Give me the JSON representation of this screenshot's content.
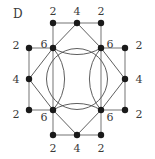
{
  "figure": {
    "panel_letter": "D",
    "panel_letter_x": 13,
    "panel_letter_y": 8,
    "width": 155,
    "height": 159,
    "background_color": "#ffffff",
    "edge_color": "#808080",
    "chord_color": "#4d4d4d",
    "circle_color": "#4d4d4d",
    "node_color": "#1a1a1a",
    "label_color": "#3a3a3a",
    "node_radius": 3.2,
    "circle": {
      "cx": 77,
      "cy": 79,
      "r": 30.5
    }
  },
  "chart_data": {
    "type": "diagram",
    "title": "D",
    "xlabel": "",
    "ylabel": "",
    "nodes": [
      {
        "id": "n0",
        "x": 53,
        "y": 23,
        "value": "2",
        "label_x": 53,
        "label_y": 11,
        "label_pos": "above"
      },
      {
        "id": "n1",
        "x": 77,
        "y": 23,
        "value": "4",
        "label_x": 77,
        "label_y": 11,
        "label_pos": "above"
      },
      {
        "id": "n2",
        "x": 101,
        "y": 23,
        "value": "2",
        "label_x": 101,
        "label_y": 11,
        "label_pos": "above"
      },
      {
        "id": "n3",
        "x": 29,
        "y": 48,
        "value": "2",
        "label_x": 16,
        "label_y": 45,
        "label_pos": "left"
      },
      {
        "id": "n4",
        "x": 53,
        "y": 48,
        "value": "6",
        "label_x": 44,
        "label_y": 44,
        "label_pos": "upper-left"
      },
      {
        "id": "n5",
        "x": 101,
        "y": 48,
        "value": "6",
        "label_x": 110,
        "label_y": 44,
        "label_pos": "upper-right"
      },
      {
        "id": "n6",
        "x": 125,
        "y": 48,
        "value": "2",
        "label_x": 139,
        "label_y": 45,
        "label_pos": "right"
      },
      {
        "id": "n7",
        "x": 29,
        "y": 79,
        "value": "4",
        "label_x": 16,
        "label_y": 79,
        "label_pos": "left"
      },
      {
        "id": "n8",
        "x": 125,
        "y": 79,
        "value": "4",
        "label_x": 139,
        "label_y": 79,
        "label_pos": "right"
      },
      {
        "id": "n9",
        "x": 29,
        "y": 110,
        "value": "2",
        "label_x": 16,
        "label_y": 114,
        "label_pos": "left"
      },
      {
        "id": "n10",
        "x": 53,
        "y": 110,
        "value": "6",
        "label_x": 44,
        "label_y": 117,
        "label_pos": "lower-left"
      },
      {
        "id": "n11",
        "x": 101,
        "y": 110,
        "value": "6",
        "label_x": 110,
        "label_y": 117,
        "label_pos": "lower-right"
      },
      {
        "id": "n12",
        "x": 125,
        "y": 110,
        "value": "2",
        "label_x": 139,
        "label_y": 114,
        "label_pos": "right"
      },
      {
        "id": "n13",
        "x": 53,
        "y": 135,
        "value": "2",
        "label_x": 53,
        "label_y": 148,
        "label_pos": "below"
      },
      {
        "id": "n14",
        "x": 77,
        "y": 135,
        "value": "4",
        "label_x": 77,
        "label_y": 148,
        "label_pos": "below"
      },
      {
        "id": "n15",
        "x": 101,
        "y": 135,
        "value": "2",
        "label_x": 101,
        "label_y": 148,
        "label_pos": "below"
      }
    ],
    "straight_edges": [
      [
        "n0",
        "n1"
      ],
      [
        "n1",
        "n2"
      ],
      [
        "n0",
        "n4"
      ],
      [
        "n2",
        "n5"
      ],
      [
        "n3",
        "n4"
      ],
      [
        "n3",
        "n7"
      ],
      [
        "n6",
        "n5"
      ],
      [
        "n6",
        "n8"
      ],
      [
        "n7",
        "n9"
      ],
      [
        "n8",
        "n12"
      ],
      [
        "n9",
        "n10"
      ],
      [
        "n12",
        "n11"
      ],
      [
        "n10",
        "n13"
      ],
      [
        "n11",
        "n15"
      ],
      [
        "n13",
        "n14"
      ],
      [
        "n14",
        "n15"
      ],
      [
        "n4",
        "n10"
      ],
      [
        "n5",
        "n11"
      ]
    ],
    "chord_edges": [
      [
        "n4",
        "n1"
      ],
      [
        "n1",
        "n5"
      ],
      [
        "n4",
        "n7"
      ],
      [
        "n7",
        "n10"
      ],
      [
        "n5",
        "n8"
      ],
      [
        "n8",
        "n11"
      ],
      [
        "n10",
        "n14"
      ],
      [
        "n14",
        "n11"
      ]
    ],
    "arc_edges": [
      {
        "from": "n4",
        "to": "n5",
        "sweep": 0,
        "note": "top arc bulging upward"
      },
      {
        "from": "n10",
        "to": "n11",
        "sweep": 1,
        "note": "bottom arc bulging downward"
      },
      {
        "from": "n4",
        "to": "n10",
        "sweep": 1,
        "note": "left arc bulging leftward"
      },
      {
        "from": "n5",
        "to": "n11",
        "sweep": 0,
        "note": "right arc bulging rightward"
      }
    ],
    "node_values": [
      "2",
      "4",
      "2",
      "2",
      "6",
      "6",
      "2",
      "4",
      "4",
      "2",
      "6",
      "6",
      "2",
      "2",
      "4",
      "2"
    ],
    "legend": []
  }
}
